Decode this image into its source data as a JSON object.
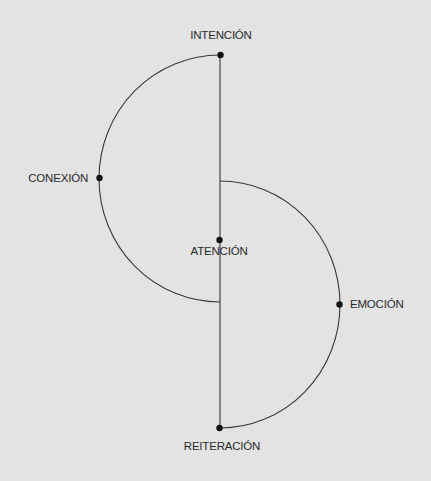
{
  "diagram": {
    "type": "double-semicircle-process",
    "colors": {
      "background": "#e3e3e3",
      "line": "#3a3a3a",
      "node": "#111111",
      "text": "#2b2b2b"
    },
    "nodes": [
      {
        "id": "intencion",
        "label": "INTENCIÓN"
      },
      {
        "id": "conexion",
        "label": "CONEXIÓN"
      },
      {
        "id": "atencion",
        "label": "ATENCIÓN"
      },
      {
        "id": "emocion",
        "label": "EMOCIÓN"
      },
      {
        "id": "reiteracion",
        "label": "REITERACIÓN"
      }
    ],
    "edges": [
      {
        "from": "intencion",
        "to": "conexion",
        "shape": "arc"
      },
      {
        "from": "intencion",
        "to": "reiteracion",
        "shape": "straight"
      },
      {
        "from": "emocion",
        "to": "reiteracion",
        "shape": "arc"
      }
    ]
  }
}
